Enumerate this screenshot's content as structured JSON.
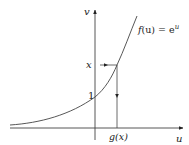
{
  "diagram": {
    "type": "function-inverse-plot",
    "axes": {
      "vertical_label": "v",
      "horizontal_label": "u"
    },
    "curve": {
      "label_f": "f",
      "label_arg": "(u) = e",
      "label_exp": "u",
      "full_label": "f(u) = e^u"
    },
    "marks": {
      "y_intercept_label": "1",
      "x_value_label": "x",
      "g_label": "g",
      "g_arg": "(x)",
      "full_g_label": "g(x)"
    },
    "colors": {
      "stroke": "#333333",
      "background": "#ffffff"
    }
  }
}
